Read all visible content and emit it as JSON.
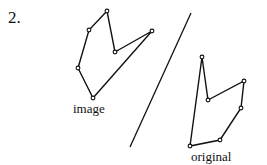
{
  "problem_number": "2.",
  "labels": {
    "image": "image",
    "original": "original"
  },
  "figures": {
    "image_polygon": [
      [
        107,
        11
      ],
      [
        89,
        30
      ],
      [
        78,
        68
      ],
      [
        93,
        98
      ],
      [
        152,
        31
      ],
      [
        115,
        52
      ]
    ],
    "original_polygon": [
      [
        202,
        57
      ],
      [
        208,
        100
      ],
      [
        244,
        81
      ],
      [
        241,
        108
      ],
      [
        220,
        140
      ],
      [
        190,
        146
      ]
    ],
    "reflection_line": [
      [
        191,
        13
      ],
      [
        130,
        147
      ]
    ]
  },
  "colors": {
    "stroke": "#111111",
    "background": "#ffffff"
  }
}
